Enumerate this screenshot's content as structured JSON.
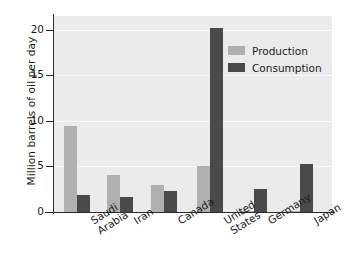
{
  "chart_data": {
    "type": "bar",
    "title": "",
    "xlabel": "",
    "ylabel": "Million barrels of oil per day",
    "ylim": [
      0,
      21.5
    ],
    "yticks": [
      "0",
      "5",
      "10",
      "15",
      "20"
    ],
    "ytick_values": [
      0,
      5,
      10,
      15,
      20
    ],
    "grid": true,
    "legend_position": "upper right",
    "categories": [
      "Saudi\nArabia",
      "Iran",
      "Canada",
      "United\nStates",
      "Germany",
      "Japan"
    ],
    "series": [
      {
        "name": "Production",
        "color": "#b0b0b0",
        "values": [
          9.4,
          4.1,
          3.0,
          5.1,
          0.15,
          0.05
        ]
      },
      {
        "name": "Consumption",
        "color": "#4a4a4a",
        "values": [
          1.9,
          1.6,
          2.3,
          20.2,
          2.5,
          5.3
        ]
      }
    ]
  },
  "style": {
    "plot_background": "#ebebeb",
    "page_background": "#ffffff",
    "gridline_color": "#fafafa",
    "axis_color": "#2b2b2b"
  }
}
